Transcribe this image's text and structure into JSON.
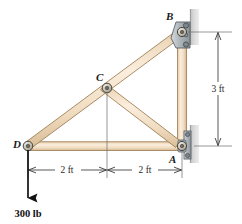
{
  "figure": {
    "background": "#ffffff",
    "member_fill": "#f3dfc4",
    "member_fill_light": "#fbeedd",
    "member_edge": "#9b7b53",
    "pin_fill": "#cfcabc",
    "pin_edge": "#4a463d",
    "wall_fill": "#c9c9c9",
    "plate_fill": "#b9c0c4",
    "plate_edge": "#5a6166",
    "dim_color": "#3a3a3a",
    "load_color": "#111111"
  },
  "joints": [
    {
      "id": "A",
      "label": "A",
      "x": 182,
      "y": 146,
      "label_x": 169,
      "label_y": 163,
      "support": "pin-wall"
    },
    {
      "id": "B",
      "label": "B",
      "x": 182,
      "y": 32,
      "label_x": 166,
      "label_y": 20,
      "support": "pin-wall"
    },
    {
      "id": "C",
      "label": "C",
      "x": 107,
      "y": 88,
      "label_x": 96,
      "label_y": 81,
      "support": "none"
    },
    {
      "id": "D",
      "label": "D",
      "x": 28,
      "y": 146,
      "label_x": 13,
      "label_y": 148,
      "support": "pin-free"
    }
  ],
  "members": [
    {
      "name": "top-chord-DB",
      "from": "D",
      "to": "B"
    },
    {
      "name": "bottom-chord-DA",
      "from": "D",
      "to": "A"
    },
    {
      "name": "web-CA",
      "from": "C",
      "to": "A"
    },
    {
      "name": "right-chord-BA",
      "from": "B",
      "to": "A"
    }
  ],
  "load": {
    "label": "300 lb",
    "magnitude": 300,
    "units": "lb",
    "direction": "down",
    "applied_at": "D",
    "label_x": 7,
    "label_y": 217
  },
  "dimensions": [
    {
      "name": "span-D-C",
      "label": "2 ft",
      "orientation": "horizontal",
      "x1": 28,
      "x2": 107,
      "y": 170,
      "text_x": 67,
      "text_y": 173
    },
    {
      "name": "span-C-A",
      "label": "2 ft",
      "orientation": "horizontal",
      "x1": 107,
      "x2": 182,
      "y": 170,
      "text_x": 144,
      "text_y": 173
    },
    {
      "name": "height-A-B",
      "label": "3 ft",
      "orientation": "vertical",
      "y1": 32,
      "y2": 146,
      "x": 218,
      "text_x": 218,
      "text_y": 92
    }
  ],
  "icons": {
    "load_arrow": "arrow-down-icon",
    "pin_joint": "pin-joint-icon",
    "wall_support": "wall-support-icon"
  }
}
